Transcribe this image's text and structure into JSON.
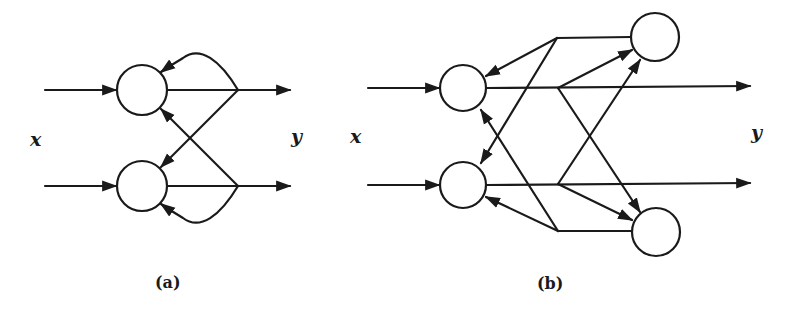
{
  "figure": {
    "panels": [
      {
        "id": "a",
        "caption": "(a)",
        "input_label": "x",
        "output_label": "y",
        "description": "Two-neuron network with self-feedback loops and cross connections",
        "nodes": 2
      },
      {
        "id": "b",
        "caption": "(b)",
        "input_label": "x",
        "output_label": "y",
        "description": "Two input neurons with two hidden feedback neurons",
        "nodes": 4
      }
    ],
    "colors": {
      "line": "#1a1a1a",
      "background": "#ffffff"
    }
  }
}
